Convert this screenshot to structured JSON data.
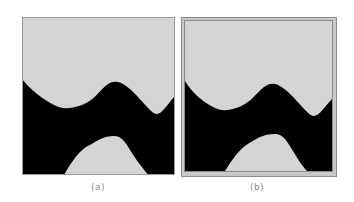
{
  "figure": {
    "panels": [
      {
        "id": "a",
        "caption": "(a)",
        "framed": false
      },
      {
        "id": "b",
        "caption": "(b)",
        "framed": true
      }
    ],
    "colors": {
      "region_light": "#d4d4d4",
      "region_dark": "#000000",
      "frame": "#c8c8c8",
      "frame_line": "#7a7a7a",
      "caption": "#8a8a8a"
    }
  }
}
